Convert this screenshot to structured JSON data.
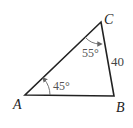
{
  "diagram": {
    "type": "triangle",
    "vertices": {
      "A": {
        "label": "A"
      },
      "B": {
        "label": "B"
      },
      "C": {
        "label": "C"
      }
    },
    "angles": {
      "A": "45°",
      "C": "55°"
    },
    "sides": {
      "BC": "40"
    },
    "colors": {
      "stroke": "#222222",
      "arc": "#666666"
    }
  }
}
